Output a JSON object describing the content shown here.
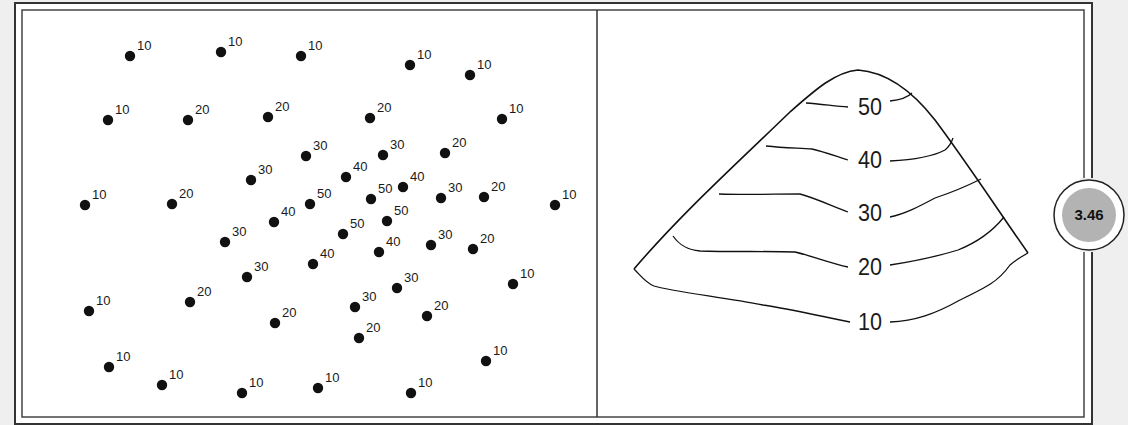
{
  "figure": {
    "badge": {
      "label": "3.46",
      "fill": "#b3b3b3"
    },
    "colors": {
      "background": "#efefef",
      "panel": "#ffffff",
      "frame": "#333333",
      "ink": "#111111"
    },
    "left_panel": {
      "title": "Spot elevations",
      "points": [
        {
          "x": 130,
          "y": 56,
          "label": "10"
        },
        {
          "x": 221,
          "y": 52,
          "label": "10"
        },
        {
          "x": 301,
          "y": 56,
          "label": "10"
        },
        {
          "x": 410,
          "y": 65,
          "label": "10"
        },
        {
          "x": 470,
          "y": 75,
          "label": "10"
        },
        {
          "x": 108,
          "y": 120,
          "label": "10"
        },
        {
          "x": 188,
          "y": 120,
          "label": "20"
        },
        {
          "x": 268,
          "y": 117,
          "label": "20"
        },
        {
          "x": 370,
          "y": 118,
          "label": "20"
        },
        {
          "x": 502,
          "y": 119,
          "label": "10"
        },
        {
          "x": 306,
          "y": 156,
          "label": "30"
        },
        {
          "x": 383,
          "y": 155,
          "label": "30"
        },
        {
          "x": 445,
          "y": 153,
          "label": "20"
        },
        {
          "x": 251,
          "y": 180,
          "label": "30"
        },
        {
          "x": 346,
          "y": 177,
          "label": "40"
        },
        {
          "x": 403,
          "y": 187,
          "label": "40"
        },
        {
          "x": 85,
          "y": 205,
          "label": "10"
        },
        {
          "x": 172,
          "y": 204,
          "label": "20"
        },
        {
          "x": 310,
          "y": 204,
          "label": "50"
        },
        {
          "x": 371,
          "y": 199,
          "label": "50"
        },
        {
          "x": 441,
          "y": 198,
          "label": "30"
        },
        {
          "x": 484,
          "y": 197,
          "label": "20"
        },
        {
          "x": 555,
          "y": 205,
          "label": "10"
        },
        {
          "x": 274,
          "y": 222,
          "label": "40"
        },
        {
          "x": 387,
          "y": 221,
          "label": "50"
        },
        {
          "x": 225,
          "y": 242,
          "label": "30"
        },
        {
          "x": 343,
          "y": 234,
          "label": "50"
        },
        {
          "x": 379,
          "y": 252,
          "label": "40"
        },
        {
          "x": 431,
          "y": 245,
          "label": "30"
        },
        {
          "x": 473,
          "y": 249,
          "label": "20"
        },
        {
          "x": 247,
          "y": 277,
          "label": "30"
        },
        {
          "x": 313,
          "y": 264,
          "label": "40"
        },
        {
          "x": 397,
          "y": 288,
          "label": "30"
        },
        {
          "x": 513,
          "y": 284,
          "label": "10"
        },
        {
          "x": 89,
          "y": 311,
          "label": "10"
        },
        {
          "x": 190,
          "y": 302,
          "label": "20"
        },
        {
          "x": 355,
          "y": 307,
          "label": "30"
        },
        {
          "x": 427,
          "y": 316,
          "label": "20"
        },
        {
          "x": 275,
          "y": 323,
          "label": "20"
        },
        {
          "x": 359,
          "y": 338,
          "label": "20"
        },
        {
          "x": 109,
          "y": 367,
          "label": "10"
        },
        {
          "x": 486,
          "y": 361,
          "label": "10"
        },
        {
          "x": 162,
          "y": 385,
          "label": "10"
        },
        {
          "x": 242,
          "y": 393,
          "label": "10"
        },
        {
          "x": 318,
          "y": 388,
          "label": "10"
        },
        {
          "x": 411,
          "y": 393,
          "label": "10"
        }
      ]
    },
    "right_panel": {
      "title": "Contour map",
      "contours": [
        {
          "label": "50",
          "lx": 870,
          "ly": 107,
          "left": "M806,103 C820,104 835,106 848,107",
          "right": "M890,101 C900,100 907,98 912,93"
        },
        {
          "label": "40",
          "lx": 870,
          "ly": 160,
          "left": "M766,146 C785,148 800,148 812,149 C825,152 838,157 848,160",
          "right": "M890,161 C910,160 930,158 945,150 C950,146 952,141 953,138"
        },
        {
          "label": "30",
          "lx": 870,
          "ly": 213,
          "left": "M719,194 C745,195 775,194 800,194 C815,198 832,206 848,212",
          "right": "M890,217 C905,214 920,206 935,198 C950,193 965,187 981,179"
        },
        {
          "label": "20",
          "lx": 870,
          "ly": 267,
          "left": "M673,236 C680,246 688,250 700,251 C730,252 770,251 795,252 C812,256 830,263 848,267",
          "right": "M890,265 C910,262 935,257 958,250 C978,242 992,232 1004,217"
        },
        {
          "label": "10",
          "lx": 870,
          "ly": 322,
          "left": "M634,269 C642,277 646,283 654,286 C670,291 720,297 763,305 C790,309 820,316 850,322",
          "right": "M890,322 C915,321 935,314 960,300 C985,288 998,282 1010,265 C1018,258 1023,256 1028,253"
        }
      ],
      "outline": "M634,269 C680,215 735,165 790,112 C815,90 835,72 858,70 C885,72 910,88 935,120 C965,160 998,210 1028,253"
    }
  }
}
